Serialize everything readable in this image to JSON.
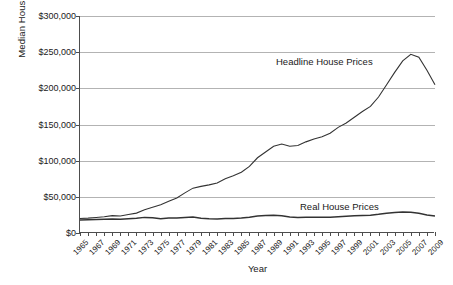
{
  "chart_data": {
    "type": "line",
    "title": "",
    "xlabel": "Year",
    "ylabel": "Median House Price",
    "ylim": [
      0,
      300000
    ],
    "xlim": [
      1965,
      2009
    ],
    "ytick_values": [
      0,
      50000,
      100000,
      150000,
      200000,
      250000,
      300000
    ],
    "ytick_labels": [
      "$0",
      "$50,000",
      "$100,000",
      "$150,000",
      "$200,000",
      "$250,000",
      "$300,000"
    ],
    "grid": true,
    "legend_position": "inline-annotation",
    "x": [
      1965,
      1966,
      1967,
      1968,
      1969,
      1970,
      1971,
      1972,
      1973,
      1974,
      1975,
      1976,
      1977,
      1978,
      1979,
      1980,
      1981,
      1982,
      1983,
      1984,
      1985,
      1986,
      1987,
      1988,
      1989,
      1990,
      1991,
      1992,
      1993,
      1994,
      1995,
      1996,
      1997,
      1998,
      1999,
      2000,
      2001,
      2002,
      2003,
      2004,
      2005,
      2006,
      2007,
      2008,
      2009
    ],
    "xtick_labels": [
      "1965",
      "1967",
      "1969",
      "1971",
      "1973",
      "1975",
      "1977",
      "1979",
      "1981",
      "1983",
      "1985",
      "1987",
      "1989",
      "1991",
      "1993",
      "1995",
      "1997",
      "1999",
      "2001",
      "2003",
      "2005",
      "2007",
      "2009"
    ],
    "series": [
      {
        "name": "Headline House Prices",
        "values": [
          20000,
          20500,
          21500,
          22500,
          24000,
          23500,
          25500,
          27500,
          32000,
          35500,
          39000,
          44000,
          48500,
          55500,
          62000,
          64500,
          66500,
          69000,
          75000,
          79000,
          84000,
          92000,
          104000,
          112000,
          120000,
          123000,
          120000,
          121000,
          126000,
          130000,
          133000,
          138000,
          146000,
          152000,
          160000,
          168000,
          175000,
          188000,
          205000,
          222000,
          238000,
          247000,
          243000,
          225000,
          205000
        ]
      },
      {
        "name": "Real House Prices",
        "values": [
          18000,
          18200,
          18600,
          18900,
          19300,
          19000,
          19800,
          20300,
          21600,
          21200,
          19800,
          20600,
          20800,
          21600,
          22000,
          20500,
          19700,
          19300,
          20000,
          20200,
          20600,
          21800,
          23600,
          24200,
          24700,
          23700,
          22200,
          21600,
          21800,
          21800,
          21700,
          21900,
          22600,
          23100,
          23800,
          24200,
          24600,
          25800,
          27400,
          28400,
          29000,
          28800,
          27200,
          24800,
          23400
        ]
      }
    ],
    "annotations": [
      {
        "id": "headline",
        "text": "Headline House Prices"
      },
      {
        "id": "real",
        "text": "Real House Prices"
      }
    ]
  }
}
